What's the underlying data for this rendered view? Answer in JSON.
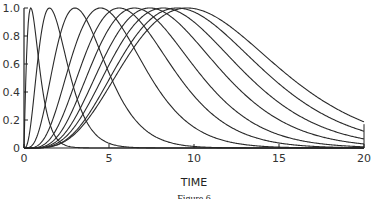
{
  "chart_data": {
    "type": "line",
    "title": "",
    "xlabel": "TIME",
    "ylabel": "",
    "caption": "Figure 6",
    "xlim": [
      0,
      20
    ],
    "ylim": [
      0,
      1.0
    ],
    "x_ticks": [
      0,
      5,
      10,
      15,
      20
    ],
    "x_tick_labels": [
      "0",
      "5",
      "10",
      "15",
      "20"
    ],
    "y_ticks": [
      0,
      0.2,
      0.4,
      0.6,
      0.8,
      1.0
    ],
    "y_tick_labels": [
      "0",
      "0.2",
      "0.4",
      "0.6",
      "0.8",
      "1.0"
    ],
    "grid": false,
    "legend": null,
    "series_description": "Family of normalized gamma-like response curves, each peaking at 1.0; later peaks are broader",
    "series": [
      {
        "name": "curve-1",
        "peak_time": 0.4,
        "shape_k": 1.2
      },
      {
        "name": "curve-2",
        "peak_time": 1.5,
        "shape_k": 3.0
      },
      {
        "name": "curve-3",
        "peak_time": 3.0,
        "shape_k": 4.0
      },
      {
        "name": "curve-4",
        "peak_time": 4.5,
        "shape_k": 4.5
      },
      {
        "name": "curve-5",
        "peak_time": 5.6,
        "shape_k": 4.8
      },
      {
        "name": "curve-6",
        "peak_time": 6.5,
        "shape_k": 5.0
      },
      {
        "name": "curve-7",
        "peak_time": 7.4,
        "shape_k": 5.0
      },
      {
        "name": "curve-8",
        "peak_time": 8.2,
        "shape_k": 5.0
      },
      {
        "name": "curve-9",
        "peak_time": 9.0,
        "shape_k": 5.0
      },
      {
        "name": "curve-10",
        "peak_time": 9.6,
        "shape_k": 4.8
      }
    ]
  }
}
